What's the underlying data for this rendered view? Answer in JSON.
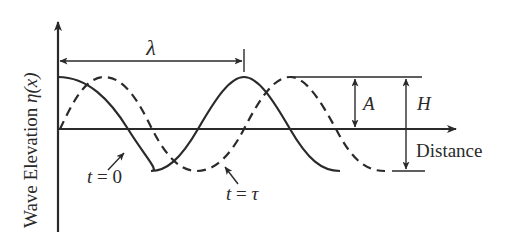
{
  "diagram": {
    "y_axis_label": "Wave Elevation η(x)",
    "y_axis_label_text": "Wave Elevation ",
    "y_axis_label_symbol": "η(x)",
    "x_axis_label": "Distance",
    "wavelength_label": "λ",
    "amplitude_label": "A",
    "wave_height_label": "H",
    "curves": [
      {
        "name": "t = 0",
        "label_t": "t",
        "label_eq": " = ",
        "label_val": "0",
        "style": "solid",
        "phase_shift": 0
      },
      {
        "name": "t = τ",
        "label_t": "t",
        "label_eq": " = ",
        "label_val": "τ",
        "style": "dashed",
        "phase_shift": "quarter wavelength (approx)"
      }
    ],
    "colors": {
      "line": "#2a2a2a",
      "background": "#ffffff"
    }
  }
}
